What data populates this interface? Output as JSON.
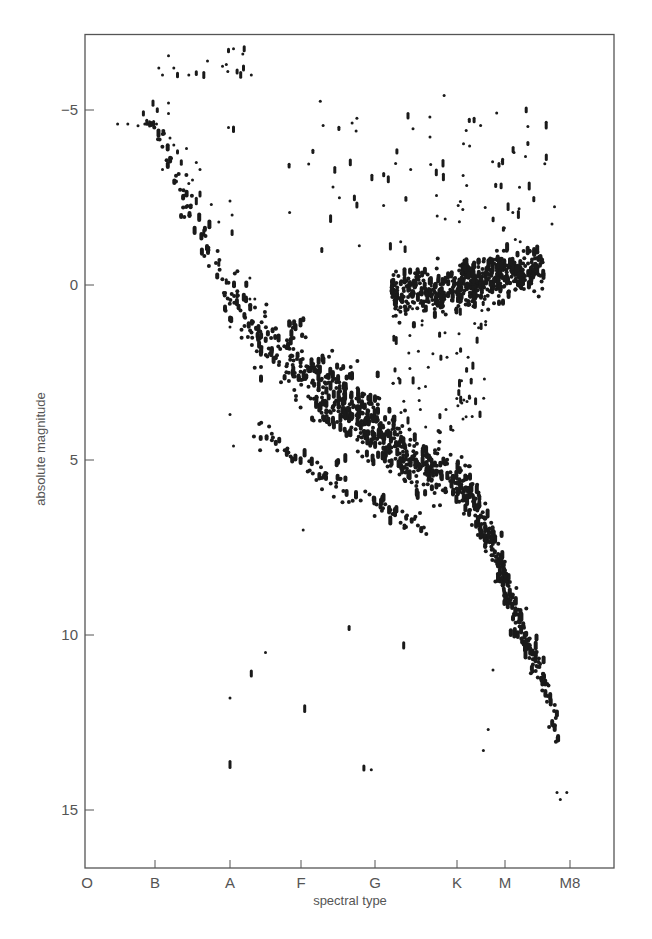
{
  "chart_data": {
    "type": "scatter",
    "title": "",
    "xlabel": "spectral type",
    "ylabel": "absolute magnitude",
    "x_ticks": [
      {
        "label": "O",
        "pos": 0
      },
      {
        "label": "B",
        "pos": 1
      },
      {
        "label": "A",
        "pos": 2
      },
      {
        "label": "F",
        "pos": 3
      },
      {
        "label": "G",
        "pos": 4
      },
      {
        "label": "K",
        "pos": 5
      },
      {
        "label": "M",
        "pos": 6
      },
      {
        "label": "M8",
        "pos": 7
      }
    ],
    "y_ticks": [
      {
        "label": "−5",
        "value": -5
      },
      {
        "label": "0",
        "value": 0
      },
      {
        "label": "5",
        "value": 5
      },
      {
        "label": "10",
        "value": 10
      },
      {
        "label": "15",
        "value": 15
      }
    ],
    "xlim": [
      0,
      7.68
    ],
    "ylim": [
      -7.1,
      16.4
    ],
    "y_inverted": true,
    "grid": false,
    "legend": null,
    "point_color": "#1a1a1a",
    "series": [
      {
        "name": "main sequence",
        "kind": "band",
        "path": [
          [
            1.0,
            -4.6
          ],
          [
            1.3,
            -3.0
          ],
          [
            1.6,
            -1.5
          ],
          [
            2.0,
            0.4
          ],
          [
            2.3,
            1.3
          ],
          [
            2.8,
            2.0
          ],
          [
            3.2,
            2.8
          ],
          [
            3.6,
            3.4
          ],
          [
            4.0,
            4.1
          ],
          [
            4.4,
            4.9
          ],
          [
            4.8,
            5.4
          ],
          [
            5.3,
            6.0
          ],
          [
            5.6,
            7.0
          ],
          [
            5.9,
            8.0
          ],
          [
            6.1,
            9.0
          ],
          [
            6.3,
            10.0
          ],
          [
            6.5,
            10.8
          ],
          [
            6.7,
            11.8
          ],
          [
            6.8,
            13.0
          ]
        ],
        "width_mag": [
          0.5,
          0.6,
          0.6,
          0.6,
          0.7,
          0.8,
          0.9,
          0.9,
          0.8,
          0.7,
          0.6,
          0.5,
          0.5,
          0.5,
          0.4,
          0.4,
          0.3,
          0.3,
          0.3
        ],
        "density": [
          3,
          3,
          3,
          4,
          7,
          10,
          16,
          20,
          20,
          18,
          14,
          12,
          10,
          9,
          8,
          6,
          5,
          3,
          2
        ]
      },
      {
        "name": "giant branch",
        "kind": "blob",
        "center": [
          5.4,
          -0.1
        ],
        "extent": [
          1.2,
          0.7
        ],
        "tilt": -0.35,
        "count": 520
      },
      {
        "name": "subgiants / scattered",
        "kind": "scatter-box",
        "box": [
          4.2,
          5.6,
          -0.2,
          4.2
        ],
        "count": 90
      },
      {
        "name": "subdwarfs",
        "kind": "band",
        "path": [
          [
            2.4,
            4.2
          ],
          [
            3.0,
            5.0
          ],
          [
            3.6,
            5.8
          ],
          [
            4.2,
            6.4
          ],
          [
            4.6,
            7.0
          ]
        ],
        "width_mag": [
          0.3,
          0.3,
          0.3,
          0.3,
          0.3
        ],
        "density": [
          3,
          4,
          4,
          4,
          3
        ]
      },
      {
        "name": "supergiants / bright giants",
        "kind": "scatter-box",
        "box": [
          2.8,
          6.9,
          -5.6,
          -1.0
        ],
        "count": 85
      },
      {
        "name": "white dwarfs and isolated",
        "kind": "points",
        "points": [
          [
            2.0,
            11.8
          ],
          [
            2.0,
            13.7
          ],
          [
            2.3,
            11.1
          ],
          [
            2.5,
            10.5
          ],
          [
            3.05,
            12.1
          ],
          [
            3.65,
            9.8
          ],
          [
            3.85,
            13.8
          ],
          [
            3.95,
            13.85
          ],
          [
            4.35,
            10.3
          ],
          [
            3.03,
            7.0
          ],
          [
            5.55,
            13.3
          ],
          [
            5.65,
            12.7
          ],
          [
            5.75,
            11.0
          ],
          [
            6.95,
            14.5
          ],
          [
            6.85,
            14.7
          ],
          [
            6.8,
            14.5
          ]
        ]
      },
      {
        "name": "early-type bright stars",
        "kind": "points",
        "points": [
          [
            0.45,
            -4.6
          ],
          [
            0.6,
            -4.6
          ],
          [
            0.75,
            -4.55
          ],
          [
            0.85,
            -4.6
          ],
          [
            0.9,
            -4.6
          ],
          [
            0.88,
            -4.65
          ],
          [
            0.92,
            -4.6
          ],
          [
            0.95,
            -4.6
          ],
          [
            0.98,
            -4.62
          ],
          [
            0.83,
            -4.9
          ],
          [
            0.97,
            -5.2
          ],
          [
            1.03,
            -5.0
          ],
          [
            1.02,
            -4.6
          ],
          [
            1.18,
            -5.2
          ],
          [
            1.18,
            -4.9
          ],
          [
            1.1,
            -6.0
          ],
          [
            1.05,
            -6.2
          ],
          [
            1.18,
            -6.55
          ],
          [
            1.25,
            -6.2
          ],
          [
            1.3,
            -6.0
          ],
          [
            1.45,
            -6.0
          ],
          [
            1.55,
            -6.05
          ],
          [
            1.65,
            -6.0
          ],
          [
            1.7,
            -6.4
          ],
          [
            1.9,
            -6.25
          ],
          [
            1.95,
            -6.3
          ],
          [
            1.97,
            -6.1
          ],
          [
            2.1,
            -6.1
          ],
          [
            2.15,
            -6.0
          ],
          [
            2.3,
            -6.0
          ],
          [
            1.98,
            -6.7
          ],
          [
            2.05,
            -6.75
          ],
          [
            2.18,
            -6.6
          ],
          [
            2.2,
            -6.75
          ],
          [
            2.19,
            -6.2
          ],
          [
            1.98,
            -4.5
          ],
          [
            2.05,
            -4.45
          ],
          [
            1.2,
            -4.2
          ],
          [
            1.25,
            -4.0
          ],
          [
            1.3,
            -3.8
          ],
          [
            1.42,
            -3.9
          ],
          [
            1.35,
            -3.5
          ],
          [
            1.1,
            -3.3
          ],
          [
            1.55,
            -3.5
          ],
          [
            1.6,
            -3.3
          ],
          [
            1.5,
            -3.0
          ],
          [
            1.45,
            -2.9
          ],
          [
            1.6,
            -2.6
          ],
          [
            1.55,
            -2.4
          ],
          [
            1.75,
            -2.3
          ],
          [
            1.85,
            -1.8
          ],
          [
            1.65,
            -1.5
          ],
          [
            1.72,
            -1.0
          ],
          [
            1.85,
            -0.6
          ],
          [
            1.95,
            -0.1
          ],
          [
            2.0,
            1.2
          ],
          [
            2.1,
            0.3
          ],
          [
            2.28,
            0.4
          ],
          [
            2.35,
            0.4
          ],
          [
            2.28,
            -0.2
          ],
          [
            2.0,
            -2.4
          ],
          [
            2.03,
            -1.5
          ],
          [
            2.03,
            -2.0
          ],
          [
            2.0,
            3.7
          ],
          [
            2.05,
            4.6
          ]
        ]
      }
    ]
  }
}
